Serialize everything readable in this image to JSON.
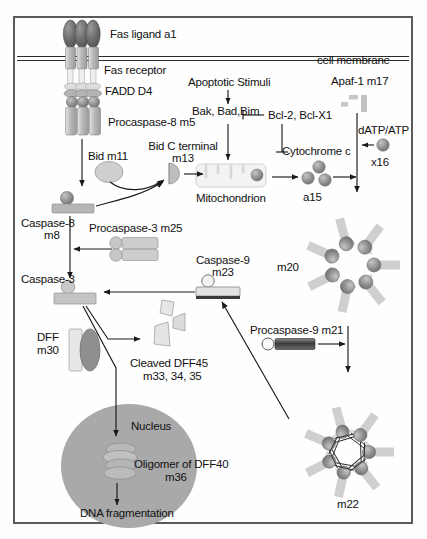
{
  "figure": {
    "frame_color": "#5a5a5a",
    "background": "#fefefe"
  },
  "palette": {
    "dark_gray": "#6f6f6f",
    "mid_gray": "#9a9a9a",
    "light_gray": "#c9c9c9",
    "pale_gray": "#dcdcdc",
    "nucleus_gray": "#a8a8a8",
    "line": "#1a1a1a"
  },
  "labels": {
    "fas_ligand": "Fas ligand a1",
    "fas_receptor": "Fas receptor",
    "fadd": "FADD D4",
    "procaspase8": "Procaspase-8 m5",
    "bid": "Bid m11",
    "bid_c_terminal_line1": "Bid C terminal",
    "bid_c_terminal_line2": "m13",
    "caspase8_line1": "Caspase-8",
    "caspase8_line2": "m8",
    "procaspase3": "Procaspase-3 m25",
    "caspase3": "Caspase-3",
    "dff_line1": "DFF",
    "dff_line2": "m30",
    "cleaved_dff45_line1": "Cleaved DFF45",
    "cleaved_dff45_line2": "m33, 34, 35",
    "nucleus": "Nucleus",
    "oligomer_line1": "Oligomer of DFF40",
    "oligomer_line2": "m36",
    "dna_fragmentation": "DNA fragmentation",
    "cell_membrane": "cell membrane",
    "apoptotic_stimuli": "Apoptotic Stimuli",
    "bak_bad_bim": "Bak, Bad,Bim",
    "bcl2_bclx1": "Bcl-2, Bcl-X1",
    "mitochondrion": "Mitochondrion",
    "cytochrome_c": "Cytochrome c",
    "a15": "a15",
    "apaf1": "Apaf-1 m17",
    "datp_atp": "dATP/ATP",
    "x16": "x16",
    "m20": "m20",
    "caspase9_line1": "Caspase-9",
    "caspase9_line2": "m23",
    "procaspase9": "Procaspase-9 m21",
    "m22": "m22"
  },
  "pathway": {
    "nodes": [
      {
        "id": "a1",
        "name": "Fas ligand a1",
        "type": "ligand-trimer"
      },
      {
        "id": "fas-receptor",
        "name": "Fas receptor",
        "type": "membrane-receptor"
      },
      {
        "id": "D4",
        "name": "FADD D4",
        "type": "adaptor"
      },
      {
        "id": "m5",
        "name": "Procaspase-8 m5",
        "type": "zymogen"
      },
      {
        "id": "m11",
        "name": "Bid m11",
        "type": "protein"
      },
      {
        "id": "m13",
        "name": "Bid C terminal m13",
        "type": "cleaved-fragment"
      },
      {
        "id": "m8",
        "name": "Caspase-8 m8",
        "type": "active-protease"
      },
      {
        "id": "m25",
        "name": "Procaspase-3 m25",
        "type": "zymogen"
      },
      {
        "id": "caspase-3",
        "name": "Caspase-3",
        "type": "active-protease"
      },
      {
        "id": "m30",
        "name": "DFF m30",
        "type": "complex"
      },
      {
        "id": "m33-35",
        "name": "Cleaved DFF45 m33, 34, 35",
        "type": "fragments"
      },
      {
        "id": "m36",
        "name": "Oligomer of DFF40 m36",
        "type": "oligomer"
      },
      {
        "id": "dna-frag",
        "name": "DNA fragmentation",
        "type": "outcome"
      },
      {
        "id": "stimuli",
        "name": "Apoptotic Stimuli",
        "type": "input"
      },
      {
        "id": "bak-bad-bim",
        "name": "Bak, Bad,Bim",
        "type": "protein-group"
      },
      {
        "id": "bcl2",
        "name": "Bcl-2, Bcl-X1",
        "type": "inhibitor"
      },
      {
        "id": "mito",
        "name": "Mitochondrion",
        "type": "organelle"
      },
      {
        "id": "a15",
        "name": "Cytochrome c a15",
        "type": "protein"
      },
      {
        "id": "m17",
        "name": "Apaf-1 m17",
        "type": "protein"
      },
      {
        "id": "x16",
        "name": "dATP/ATP x16",
        "type": "cofactor"
      },
      {
        "id": "m20",
        "name": "m20",
        "type": "apoptosome"
      },
      {
        "id": "m21",
        "name": "Procaspase-9 m21",
        "type": "zymogen"
      },
      {
        "id": "m22",
        "name": "m22",
        "type": "apoptosome-bound"
      },
      {
        "id": "m23",
        "name": "Caspase-9 m23",
        "type": "active-protease"
      }
    ],
    "edges": [
      {
        "from": "m5",
        "to": "m8",
        "kind": "arrow"
      },
      {
        "from": "m8",
        "to": "m13",
        "kind": "curved-arrow"
      },
      {
        "from": "m11",
        "to": "m13",
        "kind": "curved-arrow"
      },
      {
        "from": "m13",
        "to": "mito",
        "kind": "arrow"
      },
      {
        "from": "m8",
        "to": "caspase-3",
        "kind": "arrow"
      },
      {
        "from": "m25",
        "to": "caspase-3",
        "kind": "arrow"
      },
      {
        "from": "caspase-3",
        "to": "m33-35",
        "kind": "arrow"
      },
      {
        "from": "caspase-3",
        "to": "m36",
        "kind": "arrow"
      },
      {
        "from": "m36",
        "to": "dna-frag",
        "kind": "arrow"
      },
      {
        "from": "stimuli",
        "to": "bak-bad-bim",
        "kind": "arrow"
      },
      {
        "from": "bak-bad-bim",
        "to": "mito",
        "kind": "arrow"
      },
      {
        "from": "bcl2",
        "to": "bak-bad-bim",
        "kind": "inhibition"
      },
      {
        "from": "bcl2",
        "to": "cytochrome-c",
        "kind": "inhibition"
      },
      {
        "from": "mito",
        "to": "a15",
        "kind": "arrow"
      },
      {
        "from": "a15",
        "to": "m20",
        "kind": "arrow"
      },
      {
        "from": "m17",
        "to": "m20",
        "kind": "arrow"
      },
      {
        "from": "x16",
        "to": "m20",
        "kind": "arrow"
      },
      {
        "from": "m21",
        "to": "m22",
        "kind": "arrow"
      },
      {
        "from": "m20",
        "to": "m22",
        "kind": "arrow"
      },
      {
        "from": "m22",
        "to": "m23",
        "kind": "arrow"
      },
      {
        "from": "m23",
        "to": "caspase-3",
        "kind": "arrow"
      }
    ]
  }
}
